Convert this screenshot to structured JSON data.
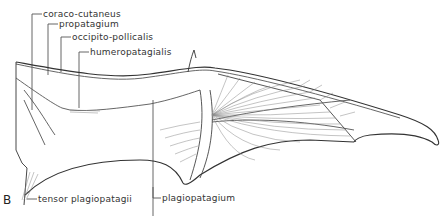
{
  "figure": {
    "panel_letter": "B",
    "labels": [
      {
        "text": "coraco-cutaneus"
      },
      {
        "text": "propatagium"
      },
      {
        "text": "occipito-pollicalis"
      },
      {
        "text": "humeropatagialis"
      },
      {
        "text": "tensor plagiopatagii"
      },
      {
        "text": "plagiopatagium"
      }
    ]
  }
}
